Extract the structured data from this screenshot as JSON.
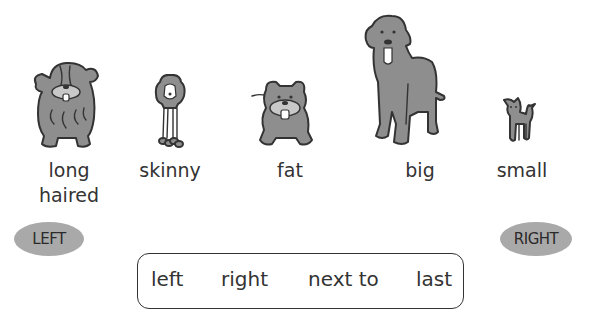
{
  "dogs": [
    {
      "id": "long-haired",
      "label_line1": "long",
      "label_line2": "haired"
    },
    {
      "id": "skinny",
      "label_line1": "skinny"
    },
    {
      "id": "fat",
      "label_line1": "fat"
    },
    {
      "id": "big",
      "label_line1": "big"
    },
    {
      "id": "small",
      "label_line1": "small"
    }
  ],
  "directions": {
    "left": "LEFT",
    "right": "RIGHT"
  },
  "word_box": {
    "words": [
      "left",
      "right",
      "next to",
      "last"
    ]
  },
  "colors": {
    "fur": "#8e8e8e",
    "bubble": "#a9a9a9",
    "outline": "#333333"
  }
}
